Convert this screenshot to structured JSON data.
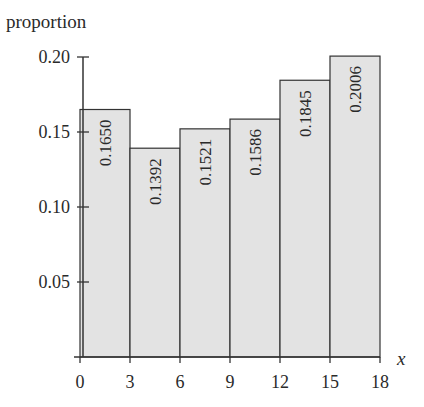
{
  "chart_data": {
    "type": "bar",
    "subtype": "histogram",
    "title": "",
    "xlabel": "x",
    "ylabel": "proportion",
    "bins": [
      [
        0,
        3
      ],
      [
        3,
        6
      ],
      [
        6,
        9
      ],
      [
        9,
        12
      ],
      [
        12,
        15
      ],
      [
        15,
        18
      ]
    ],
    "categories": [
      "0-3",
      "3-6",
      "6-9",
      "9-12",
      "12-15",
      "15-18"
    ],
    "values": [
      0.165,
      0.1392,
      0.1521,
      0.1586,
      0.1845,
      0.2006
    ],
    "value_labels": [
      "0.1650",
      "0.1392",
      "0.1521",
      "0.1586",
      "0.1845",
      "0.2006"
    ],
    "xticks": [
      0,
      3,
      6,
      9,
      12,
      15,
      18
    ],
    "xtick_labels": [
      "0",
      "3",
      "6",
      "9",
      "12",
      "15",
      "18"
    ],
    "yticks": [
      0.05,
      0.1,
      0.15,
      0.2
    ],
    "ytick_labels": [
      "0.05",
      "0.10",
      "0.15",
      "0.20"
    ],
    "xlim": [
      0,
      18
    ],
    "ylim": [
      0,
      0.2
    ],
    "grid": false,
    "legend": null,
    "bar_fill": "#e3e3e3",
    "bar_stroke": "#333333"
  }
}
